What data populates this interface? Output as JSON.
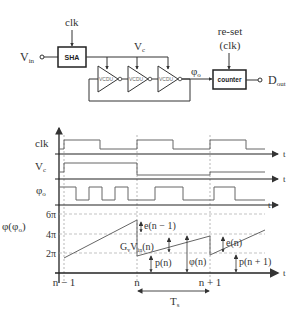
{
  "circuit": {
    "input_label": "V",
    "input_sub": "in",
    "clk_label": "clk",
    "sha_label": "SHA",
    "vc_label": "V",
    "vc_sub": "c",
    "vcdu_label": "VCDU",
    "phi_label": "φ",
    "phi_sub": "o",
    "counter_label": "counter",
    "reset_label_1": "re-set",
    "reset_label_2": "(clk)",
    "output_label": "D",
    "output_sub": "out"
  },
  "timing": {
    "clk_label": "clk",
    "vc_label": "V",
    "vc_sub": "c",
    "phi_label": "φ",
    "phi_sub": "o",
    "t_label": "t"
  },
  "phase_plot": {
    "ylabel": "φ(φ",
    "ylabel_sub": "o",
    "ylabel_end": ")",
    "yticks": [
      "6π",
      "4π",
      "2π"
    ],
    "xticks": [
      "n − 1",
      "n",
      "n + 1"
    ],
    "t_label": "t",
    "annotations": {
      "e_prev": "e(n − 1)",
      "gv": "G",
      "gv_sub": "v",
      "vin": "V",
      "vin_sub": "in",
      "vin_arg": "(n)",
      "p_n": "p(n)",
      "phi_n": "φ(n)",
      "e_n": "e(n)",
      "p_next": "p(n + 1)"
    },
    "period_label": "T",
    "period_sub": "s"
  }
}
